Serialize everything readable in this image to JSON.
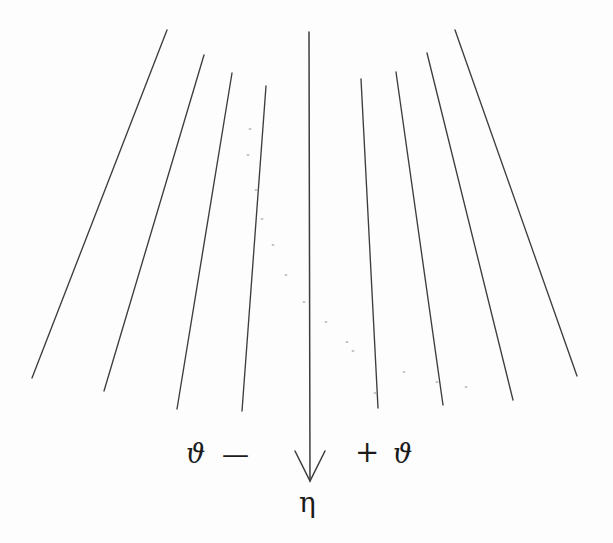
{
  "figure": {
    "name": "angular-deflection-ray-fan",
    "background_color": "#fdfdfd",
    "ink_color": "#3d3d3d",
    "text_color": "#1b1b1b",
    "width": 613,
    "height": 543
  },
  "labels": {
    "theta_left": "ϑ",
    "minus_sign": "—",
    "plus_sign": "+",
    "theta_right": "ϑ",
    "eta": "η"
  },
  "axis_arrow": {
    "name": "central-downward-axis-arrow",
    "x_top": 309,
    "y_top": 32,
    "x_bottom": 310,
    "y_bottom": 481,
    "head_half_width": 15,
    "head_length": 30
  },
  "chart_data": {
    "type": "line",
    "title": "",
    "subtitle": "",
    "xlabel": "",
    "ylabel": "",
    "grid": false,
    "legend_position": "none",
    "annotations": [
      {
        "text": "ϑ",
        "x": 186,
        "y": 440,
        "role": "negative-angle-symbol"
      },
      {
        "text": "—",
        "x": 222,
        "y": 441,
        "role": "negative-sign"
      },
      {
        "text": "+",
        "x": 355,
        "y": 438,
        "role": "positive-sign"
      },
      {
        "text": "ϑ",
        "x": 393,
        "y": 440,
        "role": "positive-angle-symbol"
      },
      {
        "text": "η",
        "x": 299,
        "y": 489,
        "role": "axis-symbol"
      }
    ],
    "series": [
      {
        "name": "ray-L4",
        "x": [
          167,
          32
        ],
        "y": [
          30,
          378
        ]
      },
      {
        "name": "ray-L3",
        "x": [
          204,
          104
        ],
        "y": [
          55,
          391
        ]
      },
      {
        "name": "ray-L2",
        "x": [
          232,
          177
        ],
        "y": [
          73,
          409
        ]
      },
      {
        "name": "ray-L1",
        "x": [
          266,
          242
        ],
        "y": [
          86,
          411
        ]
      },
      {
        "name": "ray-C",
        "x": [
          309,
          310
        ],
        "y": [
          32,
          481
        ]
      },
      {
        "name": "ray-R1",
        "x": [
          361,
          378
        ],
        "y": [
          79,
          408
        ]
      },
      {
        "name": "ray-R2",
        "x": [
          396,
          443
        ],
        "y": [
          72,
          405
        ]
      },
      {
        "name": "ray-R3",
        "x": [
          427,
          513
        ],
        "y": [
          53,
          400
        ]
      },
      {
        "name": "ray-R4",
        "x": [
          455,
          577
        ],
        "y": [
          30,
          376
        ]
      }
    ],
    "speckles": [
      {
        "x": 250,
        "y": 129
      },
      {
        "x": 248,
        "y": 155
      },
      {
        "x": 256,
        "y": 190
      },
      {
        "x": 262,
        "y": 219
      },
      {
        "x": 273,
        "y": 245
      },
      {
        "x": 286,
        "y": 275
      },
      {
        "x": 304,
        "y": 302
      },
      {
        "x": 326,
        "y": 322
      },
      {
        "x": 347,
        "y": 342
      },
      {
        "x": 353,
        "y": 351
      },
      {
        "x": 404,
        "y": 372
      },
      {
        "x": 375,
        "y": 393
      },
      {
        "x": 437,
        "y": 382
      },
      {
        "x": 466,
        "y": 387
      }
    ]
  }
}
